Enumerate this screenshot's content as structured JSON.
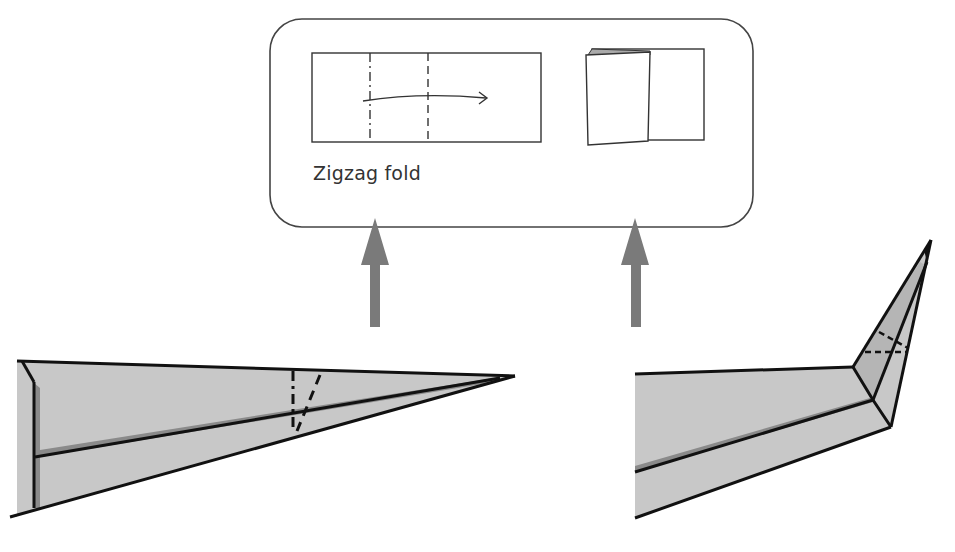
{
  "diagram": {
    "type": "origami-instruction",
    "inset": {
      "caption": "Zigzag fold",
      "before": {
        "description": "flat rectangle with mountain fold and valley fold lines and fold arrow"
      },
      "after": {
        "description": "rectangle with zigzag pleat folded over"
      }
    },
    "arrows": [
      {
        "direction": "up",
        "from": "left plane nose fold marks",
        "to": "inset before"
      },
      {
        "direction": "up",
        "from": "right plane folded nose",
        "to": "inset after"
      }
    ],
    "figures": [
      {
        "name": "plane-before-zigzag",
        "description": "side view of paper plane with mountain and valley lines near the nose"
      },
      {
        "name": "plane-after-zigzag",
        "description": "side view of paper plane with nose tip folded upward, dashed lines on nose"
      }
    ],
    "colors": {
      "paper": "#c8c8c8",
      "shadow": "#8a8a8a",
      "line": "#111111",
      "arrow": "#7a7a7a",
      "inset_border": "#444444"
    }
  }
}
